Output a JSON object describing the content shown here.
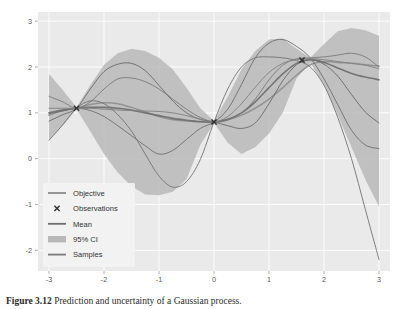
{
  "figure": {
    "caption_number": "Figure 3.12",
    "caption_text": "Prediction and uncertainty of a Gaussian process."
  },
  "chart_data": {
    "type": "line",
    "title": "",
    "xlabel": "",
    "ylabel": "",
    "xlim": [
      -3.2,
      3.2
    ],
    "ylim": [
      -2.45,
      3.2
    ],
    "xticks": [
      -3,
      -2,
      -1,
      0,
      1,
      2,
      3
    ],
    "xticklabels": [
      "-3",
      "-2",
      "-1",
      "0",
      "1",
      "2",
      "3"
    ],
    "yticks": [
      -2,
      -1,
      0,
      1,
      2,
      3
    ],
    "yticklabels": [
      "-2",
      "-1",
      "0",
      "1",
      "2",
      "3"
    ],
    "grid": true,
    "grid_color": "#ffffff",
    "panel_background": "#eaeaea",
    "legend_position": "lower left",
    "legend": [
      {
        "label": "Objective",
        "marker": "line",
        "color": "#8c8c8c"
      },
      {
        "label": "Observations",
        "marker": "x",
        "color": "#303030"
      },
      {
        "label": "Mean",
        "marker": "line",
        "color": "#6e6e6e"
      },
      {
        "label": "95% CI",
        "marker": "band",
        "color": "#b8b8b8"
      },
      {
        "label": "Samples",
        "marker": "line",
        "color": "#7a7a7a"
      }
    ],
    "observations": {
      "name": "Observations",
      "marker": "x",
      "color": "#303030",
      "x": [
        -2.5,
        0.0,
        1.6
      ],
      "y": [
        1.1,
        0.8,
        2.15
      ]
    },
    "series": [
      {
        "name": "Objective",
        "color": "#8f8f8f",
        "width": 1.5,
        "x": [
          -3.0,
          -2.75,
          -2.5,
          -2.25,
          -2.0,
          -1.75,
          -1.5,
          -1.25,
          -1.0,
          -0.75,
          -0.5,
          -0.25,
          0.0,
          0.25,
          0.5,
          0.75,
          1.0,
          1.25,
          1.5,
          1.75,
          2.0,
          2.25,
          2.5,
          2.75,
          3.0
        ],
        "y": [
          0.95,
          1.05,
          1.1,
          1.18,
          1.22,
          1.2,
          1.12,
          1.02,
          0.92,
          0.85,
          0.82,
          0.8,
          0.8,
          0.85,
          0.95,
          1.1,
          1.3,
          1.55,
          1.82,
          2.05,
          2.12,
          2.1,
          2.08,
          2.05,
          2.02
        ]
      },
      {
        "name": "Mean",
        "color": "#6e6e6e",
        "width": 1.6,
        "x": [
          -3.0,
          -2.75,
          -2.5,
          -2.25,
          -2.0,
          -1.75,
          -1.5,
          -1.25,
          -1.0,
          -0.75,
          -0.5,
          -0.25,
          0.0,
          0.25,
          0.5,
          0.75,
          1.0,
          1.25,
          1.5,
          1.75,
          2.0,
          2.25,
          2.5,
          2.75,
          3.0
        ],
        "y": [
          1.0,
          1.06,
          1.1,
          1.12,
          1.12,
          1.1,
          1.06,
          1.0,
          0.94,
          0.88,
          0.84,
          0.81,
          0.8,
          0.86,
          1.0,
          1.24,
          1.55,
          1.85,
          2.08,
          2.16,
          2.1,
          1.98,
          1.86,
          1.78,
          1.72
        ]
      },
      {
        "name": "Sample 1",
        "color": "#7c7c7c",
        "width": 1.0,
        "x": [
          -3.0,
          -2.75,
          -2.5,
          -2.25,
          -2.0,
          -1.75,
          -1.5,
          -1.25,
          -1.0,
          -0.75,
          -0.5,
          -0.25,
          0.0,
          0.25,
          0.5,
          0.75,
          1.0,
          1.25,
          1.5,
          1.75,
          2.0,
          2.25,
          2.5,
          2.75,
          3.0
        ],
        "y": [
          1.36,
          1.24,
          1.1,
          1.24,
          1.52,
          1.74,
          1.76,
          1.68,
          1.52,
          1.3,
          1.08,
          0.9,
          0.8,
          0.84,
          1.0,
          1.3,
          1.72,
          2.04,
          2.18,
          2.2,
          2.22,
          2.26,
          2.3,
          2.22,
          2.0
        ]
      },
      {
        "name": "Sample 2",
        "color": "#6a6a6a",
        "width": 1.0,
        "x": [
          -3.0,
          -2.75,
          -2.5,
          -2.25,
          -2.0,
          -1.75,
          -1.5,
          -1.25,
          -1.0,
          -0.75,
          -0.5,
          -0.25,
          0.0,
          0.25,
          0.5,
          0.75,
          1.0,
          1.25,
          1.5,
          1.75,
          2.0,
          2.25,
          2.5,
          2.75,
          3.0
        ],
        "y": [
          0.82,
          0.96,
          1.1,
          1.52,
          1.9,
          2.06,
          2.08,
          1.92,
          1.6,
          1.26,
          1.0,
          0.86,
          0.8,
          0.72,
          0.66,
          0.78,
          1.2,
          1.7,
          2.05,
          2.16,
          2.06,
          1.8,
          1.4,
          1.02,
          0.78
        ]
      },
      {
        "name": "Sample 3",
        "color": "#707070",
        "width": 1.0,
        "x": [
          -3.0,
          -2.75,
          -2.5,
          -2.25,
          -2.0,
          -1.75,
          -1.5,
          -1.25,
          -1.0,
          -0.75,
          -0.5,
          -0.25,
          0.0,
          0.25,
          0.5,
          0.75,
          1.0,
          1.25,
          1.5,
          1.75,
          2.0,
          2.25,
          2.5,
          2.75,
          3.0
        ],
        "y": [
          0.98,
          1.04,
          1.1,
          1.05,
          0.92,
          0.72,
          0.5,
          0.28,
          0.1,
          0.18,
          0.42,
          0.66,
          0.8,
          1.08,
          1.62,
          2.2,
          2.52,
          2.6,
          2.45,
          2.2,
          1.74,
          1.18,
          0.62,
          0.3,
          0.22
        ]
      },
      {
        "name": "Sample 4",
        "color": "#757575",
        "width": 1.0,
        "x": [
          -3.0,
          -2.75,
          -2.5,
          -2.25,
          -2.0,
          -1.75,
          -1.5,
          -1.25,
          -1.0,
          -0.75,
          -0.5,
          -0.25,
          0.0,
          0.25,
          0.5,
          0.75,
          1.0,
          1.25,
          1.5,
          1.75,
          2.0,
          2.25,
          2.5,
          2.75,
          3.0
        ],
        "y": [
          0.4,
          0.74,
          1.1,
          1.26,
          1.2,
          0.96,
          0.6,
          0.1,
          -0.38,
          -0.62,
          -0.5,
          -0.02,
          0.8,
          1.52,
          2.0,
          2.2,
          2.22,
          2.2,
          2.14,
          2.0,
          1.6,
          0.9,
          0.0,
          -1.1,
          -2.2
        ]
      },
      {
        "name": "Sample 5",
        "color": "#828282",
        "width": 1.0,
        "x": [
          -3.0,
          -2.75,
          -2.5,
          -2.25,
          -2.0,
          -1.75,
          -1.5,
          -1.25,
          -1.0,
          -0.75,
          -0.5,
          -0.25,
          0.0,
          0.25,
          0.5,
          0.75,
          1.0,
          1.25,
          1.5,
          1.75,
          2.0,
          2.25,
          2.5,
          2.75,
          3.0
        ],
        "y": [
          1.1,
          1.1,
          1.1,
          1.1,
          1.08,
          1.06,
          1.05,
          1.04,
          1.03,
          1.0,
          0.94,
          0.86,
          0.8,
          0.92,
          1.2,
          1.56,
          1.88,
          2.08,
          2.16,
          2.18,
          2.16,
          2.12,
          2.08,
          2.04,
          1.96
        ]
      }
    ],
    "confidence_interval": {
      "name": "95% CI",
      "color": "#b8b8b8",
      "opacity": 0.85,
      "x": [
        -3.0,
        -2.75,
        -2.5,
        -2.25,
        -2.0,
        -1.75,
        -1.5,
        -1.25,
        -1.0,
        -0.75,
        -0.5,
        -0.25,
        0.0,
        0.25,
        0.5,
        0.75,
        1.0,
        1.25,
        1.5,
        1.75,
        2.0,
        2.25,
        2.5,
        2.75,
        3.0
      ],
      "upper": [
        1.85,
        1.5,
        1.12,
        1.6,
        2.05,
        2.3,
        2.4,
        2.35,
        2.2,
        1.95,
        1.55,
        1.1,
        0.83,
        1.35,
        1.95,
        2.35,
        2.6,
        2.62,
        2.4,
        2.2,
        2.5,
        2.78,
        2.85,
        2.8,
        2.68
      ],
      "lower": [
        0.4,
        0.72,
        1.08,
        0.6,
        0.1,
        -0.3,
        -0.6,
        -0.78,
        -0.8,
        -0.72,
        -0.45,
        0.3,
        0.78,
        0.35,
        0.1,
        0.25,
        0.55,
        1.0,
        1.75,
        2.1,
        1.6,
        0.95,
        0.25,
        -0.45,
        -1.05
      ]
    }
  }
}
